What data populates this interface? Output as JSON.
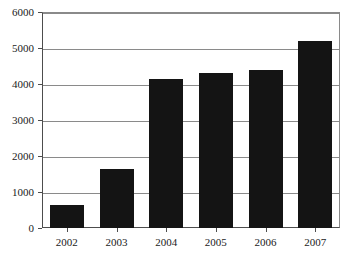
{
  "chart_data": {
    "type": "bar",
    "title": "",
    "subtitle": "",
    "xlabel": "",
    "ylabel": "",
    "categories": [
      "2002",
      "2003",
      "2004",
      "2005",
      "2006",
      "2007"
    ],
    "values": [
      630,
      1650,
      4130,
      4300,
      4380,
      5190
    ],
    "series": [
      {
        "name": "",
        "values": [
          630,
          1650,
          4130,
          4300,
          4380,
          5190
        ]
      }
    ],
    "ylim": [
      0,
      6000
    ],
    "y_ticks": [
      0,
      1000,
      2000,
      3000,
      4000,
      5000,
      6000
    ],
    "y_tick_labels": [
      "0",
      "1000",
      "2000",
      "3000",
      "4000",
      "5000",
      "6000"
    ],
    "x_tick_labels": [
      "2002",
      "2003",
      "2004",
      "2005",
      "2006",
      "2007"
    ],
    "grid": true,
    "grid_axis": "y",
    "legend": false,
    "legend_position": "none",
    "annotations": [],
    "colors": {
      "bar_fill": "#141414",
      "grid": "#8a8a8a",
      "axis": "#4d4d4d",
      "text": "#1a1a1a",
      "background": "#ffffff"
    }
  }
}
